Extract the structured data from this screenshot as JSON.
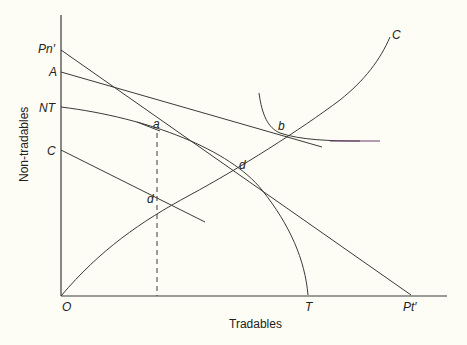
{
  "diagram": {
    "xlabel": "Tradables",
    "ylabel": "Non-tradables",
    "axis_labels": {
      "origin": "O",
      "pn": "Pn′",
      "a": "A",
      "nt": "NT",
      "c_axis": "C",
      "t": "T",
      "pt": "Pt′"
    },
    "point_labels": {
      "a": "a",
      "b": "b",
      "d_upper": "d",
      "d_lower": "d",
      "c_curve": "C"
    },
    "colors": {
      "background": "#fdfdf5",
      "line": "#3a3a3a",
      "indifference_tail": "#6a3a6a"
    }
  }
}
